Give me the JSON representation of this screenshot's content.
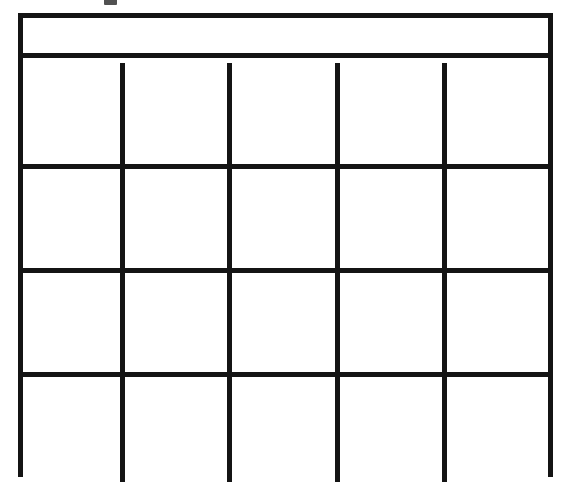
{
  "document": {
    "kind": "blank-grid-table",
    "background_color": "#ffffff",
    "line_color": "#141414",
    "canvas_width": 568,
    "canvas_height": 494
  },
  "artifact": {
    "name": "clipped-mark-top",
    "description": "",
    "color": "#2b2b2b"
  },
  "table": {
    "header": {
      "text": "",
      "spans_full_width": true
    },
    "columns": 5,
    "rows": 4,
    "column_headers": [
      "",
      "",
      "",
      "",
      ""
    ],
    "cells": [
      [
        "",
        "",
        "",
        "",
        ""
      ],
      [
        "",
        "",
        "",
        "",
        ""
      ],
      [
        "",
        "",
        "",
        "",
        ""
      ],
      [
        "",
        "",
        "",
        "",
        ""
      ]
    ]
  }
}
